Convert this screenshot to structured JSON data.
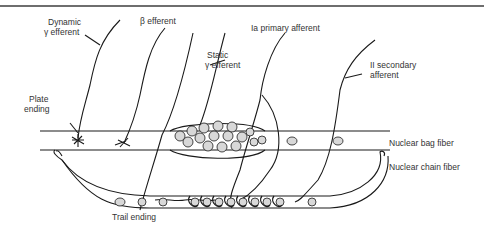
{
  "diagram": {
    "labels": {
      "dynamic_gamma_1": "Dynamic",
      "dynamic_gamma_2": "γ efferent",
      "beta_efferent": "β efferent",
      "static_gamma_1": "Static",
      "static_gamma_2": "γ efferent",
      "ia_primary": "Ia primary afferent",
      "ii_secondary_1": "II secondary",
      "ii_secondary_2": "afferent",
      "plate_ending_1": "Plate",
      "plate_ending_2": "ending",
      "trail_ending": "Trail ending",
      "nuclear_bag": "Nuclear bag fiber",
      "nuclear_chain": "Nuclear chain fiber"
    },
    "colors": {
      "line": "#1a1a1a",
      "nucleus_fill": "#d8d8d8",
      "rule": "#6e6e6e"
    }
  }
}
